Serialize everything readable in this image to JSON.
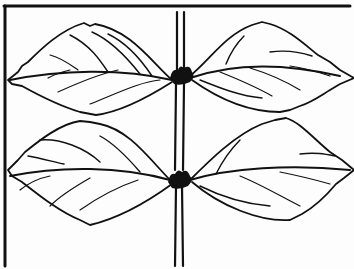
{
  "figure": {
    "subject": "line drawing of opposite leaves on a stem",
    "leaf_count": 4,
    "node_count": 2,
    "arrangement": "opposite",
    "colors": {
      "ink": "#111111",
      "paper": "#fdfdfd"
    }
  }
}
